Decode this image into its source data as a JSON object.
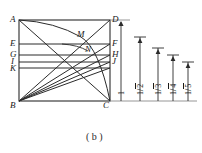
{
  "figure": {
    "caption": "( b )",
    "stroke_color": "#2b2b2b",
    "label_color": "#1a1a1a",
    "background": "#ffffff",
    "vertices": [
      {
        "name": "A",
        "label": "A",
        "x": 19,
        "y": 20
      },
      {
        "name": "D",
        "label": "D",
        "x": 110,
        "y": 20
      },
      {
        "name": "B",
        "label": "B",
        "x": 19,
        "y": 101
      },
      {
        "name": "C",
        "label": "C",
        "x": 110,
        "y": 101
      }
    ],
    "left_points": [
      {
        "name": "E",
        "label": "E",
        "y": 44
      },
      {
        "name": "G",
        "label": "G",
        "y": 55
      },
      {
        "name": "I",
        "label": "I",
        "y": 62
      },
      {
        "name": "K",
        "label": "K",
        "y": 68
      }
    ],
    "right_points": [
      {
        "name": "F",
        "label": "F",
        "y": 44
      },
      {
        "name": "H",
        "label": "H",
        "y": 55
      },
      {
        "name": "J",
        "label": "J",
        "y": 62
      }
    ],
    "interior_points": [
      {
        "name": "M",
        "label": "M",
        "x": 81,
        "y": 37
      },
      {
        "name": "N",
        "label": "N",
        "x": 88,
        "y": 51
      }
    ],
    "measurements": [
      {
        "name": "unit",
        "numerator": "1",
        "denominator": "",
        "label": "1",
        "x": 121,
        "top_y": 22,
        "bottom_y": 101
      },
      {
        "name": "one-over-root-2",
        "numerator": "1",
        "denominator": "2",
        "label": "1/√2",
        "x": 140,
        "top_y": 37,
        "bottom_y": 101
      },
      {
        "name": "one-over-root-3",
        "numerator": "1",
        "denominator": "3",
        "label": "1/√3",
        "x": 158,
        "top_y": 48,
        "bottom_y": 101
      },
      {
        "name": "one-over-root-4",
        "numerator": "1",
        "denominator": "4",
        "label": "1/√4",
        "x": 173,
        "top_y": 55,
        "bottom_y": 101
      },
      {
        "name": "one-over-root-5",
        "numerator": "1",
        "denominator": "5",
        "label": "1/√5",
        "x": 188,
        "top_y": 62,
        "bottom_y": 101
      }
    ]
  }
}
